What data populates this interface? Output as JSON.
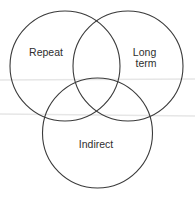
{
  "diagram": {
    "type": "venn",
    "sets": [
      {
        "id": "repeat",
        "label_lines": [
          "Repeat"
        ]
      },
      {
        "id": "long-term",
        "label_lines": [
          "Long",
          "term"
        ]
      },
      {
        "id": "indirect",
        "label_lines": [
          "Indirect"
        ]
      }
    ],
    "colors": {
      "stroke": "#3a3a3a",
      "text": "#2e2e2e",
      "background": "#ffffff"
    }
  }
}
